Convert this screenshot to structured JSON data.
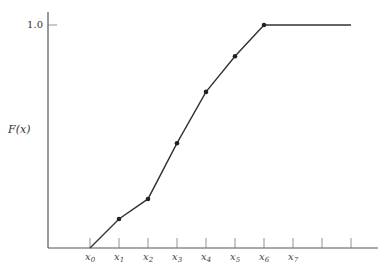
{
  "chart_data": {
    "type": "line",
    "title": "",
    "xlabel": "",
    "ylabel": "F(x)",
    "ylim": [
      0,
      1.0
    ],
    "y_ticks": [
      "1.0"
    ],
    "x_tick_labels": [
      "x0",
      "x1",
      "x2",
      "x3",
      "x4",
      "x5",
      "x6",
      "x7",
      "",
      ""
    ],
    "x_tick_labels_display": [
      {
        "base": "x",
        "sub": "0"
      },
      {
        "base": "x",
        "sub": "1"
      },
      {
        "base": "x",
        "sub": "2"
      },
      {
        "base": "x",
        "sub": "3"
      },
      {
        "base": "x",
        "sub": "4"
      },
      {
        "base": "x",
        "sub": "5"
      },
      {
        "base": "x",
        "sub": "6"
      },
      {
        "base": "x",
        "sub": "7"
      }
    ],
    "series": [
      {
        "name": "F(x)",
        "x": [
          "x0",
          "x1",
          "x2",
          "x3",
          "x4",
          "x5",
          "x6"
        ],
        "values": [
          0.0,
          0.13,
          0.22,
          0.47,
          0.7,
          0.86,
          1.0
        ],
        "continues_flat_after_last": true
      }
    ],
    "grid": false,
    "legend": "none"
  },
  "axis": {
    "ylabel": "F(x)",
    "ytick_top": "1.0"
  }
}
